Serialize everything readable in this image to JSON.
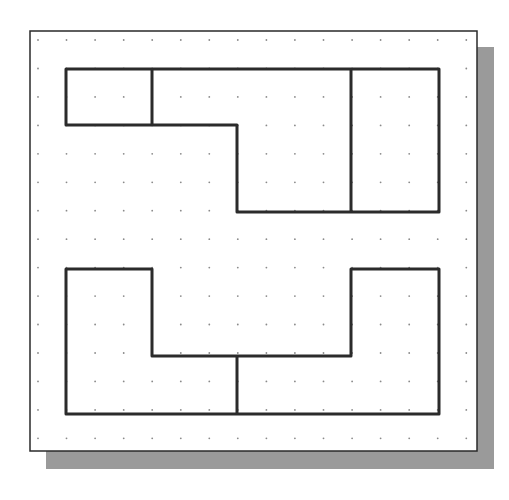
{
  "diagram": {
    "type": "dot-grid-sketch",
    "colors": {
      "background": "#ffffff",
      "panel_fill": "#ffffff",
      "panel_border": "#2a2a2a",
      "shadow": "#9a9a9a",
      "grid_dot": "#8a8a8a",
      "outline": "#2b2b2b"
    },
    "panel": {
      "x": 30,
      "y": 31,
      "width": 447,
      "height": 420,
      "shadow_offset": 16
    },
    "grid": {
      "x0": 38,
      "y0": 40,
      "spacing": 28.55,
      "cols": 16,
      "rows": 15
    },
    "shapes": [
      {
        "name": "upper-shape",
        "outline": [
          [
            66,
            69
          ],
          [
            439,
            69
          ],
          [
            439,
            212
          ],
          [
            237,
            212
          ],
          [
            237,
            125
          ],
          [
            66,
            125
          ]
        ],
        "dividers": [
          [
            [
              152,
              69
            ],
            [
              152,
              125
            ]
          ],
          [
            [
              351,
              69
            ],
            [
              351,
              212
            ]
          ]
        ]
      },
      {
        "name": "lower-shape",
        "outline": [
          [
            66,
            269
          ],
          [
            152,
            269
          ],
          [
            152,
            356
          ],
          [
            351,
            356
          ],
          [
            351,
            269
          ],
          [
            439,
            269
          ],
          [
            439,
            414
          ],
          [
            66,
            414
          ]
        ],
        "dividers": [
          [
            [
              237,
              356
            ],
            [
              237,
              414
            ]
          ]
        ]
      }
    ]
  }
}
